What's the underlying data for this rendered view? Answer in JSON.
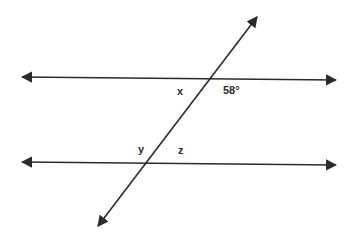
{
  "diagram": {
    "type": "parallel-lines-transversal",
    "lines": {
      "top_parallel": {
        "x1": 22,
        "y1": 77,
        "x2": 336,
        "y2": 80
      },
      "bottom_parallel": {
        "x1": 22,
        "y1": 162,
        "x2": 336,
        "y2": 165
      },
      "transversal": {
        "x1": 98,
        "y1": 226,
        "x2": 257,
        "y2": 17
      }
    },
    "labels": {
      "x": "x",
      "angle_58": "58°",
      "y": "y",
      "z": "z"
    },
    "stroke_color": "#2b2b2b"
  }
}
